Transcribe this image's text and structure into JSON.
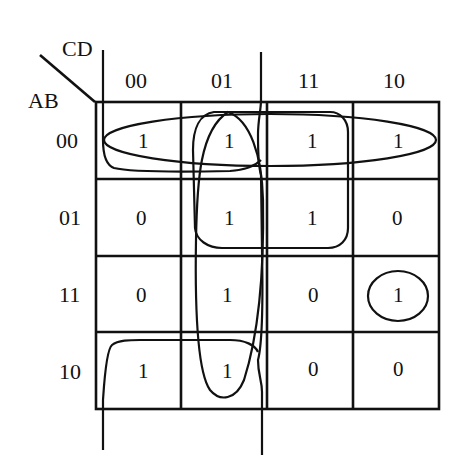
{
  "kmap": {
    "row_variable": "AB",
    "col_variable": "CD",
    "col_headers": [
      "00",
      "01",
      "11",
      "10"
    ],
    "row_headers": [
      "00",
      "01",
      "11",
      "10"
    ],
    "cells": [
      [
        "1",
        "1",
        "1",
        "1"
      ],
      [
        "0",
        "1",
        "1",
        "0"
      ],
      [
        "0",
        "1",
        "0",
        "1"
      ],
      [
        "1",
        "1",
        "0",
        "0"
      ]
    ],
    "groupings": [
      {
        "name": "row-00-group",
        "shape": "ellipse",
        "cells": [
          "00-00",
          "00-01",
          "00-11",
          "00-10"
        ]
      },
      {
        "name": "column-01-group",
        "shape": "ellipse",
        "cells": [
          "00-01",
          "01-01",
          "11-01",
          "10-01"
        ]
      },
      {
        "name": "quad-01-11-group",
        "shape": "rounded-rect",
        "cells": [
          "00-01",
          "00-11",
          "01-01",
          "01-11"
        ]
      },
      {
        "name": "single-11-10-group",
        "shape": "circle",
        "cells": [
          "11-10"
        ]
      },
      {
        "name": "corner-wrap-group",
        "shape": "edge-brackets",
        "cells": [
          "00-00",
          "00-01",
          "10-00",
          "10-01"
        ]
      }
    ]
  }
}
